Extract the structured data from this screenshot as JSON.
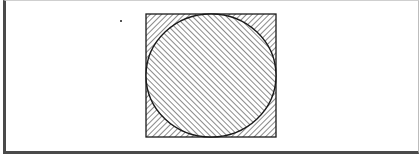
{
  "figure": {
    "description": "Hatched circle inscribed in a hatched square",
    "colors": {
      "stroke": "#1a1a1a",
      "hatch": "#2a2a2a",
      "background": "#ffffff",
      "frame_dark": "#4a4a4a",
      "frame_light": "#cfcfcf",
      "dot": "#555555"
    },
    "square": {
      "x": 146,
      "y": 14,
      "width": 130,
      "height": 123
    },
    "circle": {
      "cx": 211,
      "cy": 75.5,
      "rx": 65,
      "ry": 61.5
    },
    "hatch": {
      "square_direction": "backslash",
      "circle_direction": "forward-slash",
      "spacing": 4
    },
    "dot": {
      "x": 121,
      "y": 21,
      "size": 2
    }
  }
}
